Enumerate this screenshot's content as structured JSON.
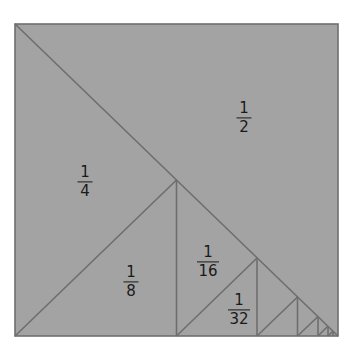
{
  "diagram": {
    "colors": {
      "background": "#ffffff",
      "fill": "#a3a3a3",
      "stroke": "#6e6e6e",
      "text": "#1a1a1a"
    },
    "square": {
      "x1": 15,
      "y1": 24,
      "x2": 338,
      "y2": 336
    },
    "labels": [
      {
        "id": "half",
        "numerator": "1",
        "denominator": "2",
        "x": 244,
        "y": 118
      },
      {
        "id": "quarter",
        "numerator": "1",
        "denominator": "4",
        "x": 85,
        "y": 182
      },
      {
        "id": "eighth",
        "numerator": "1",
        "denominator": "8",
        "x": 131,
        "y": 282
      },
      {
        "id": "sixteenth",
        "numerator": "1",
        "denominator": "16",
        "x": 208,
        "y": 262
      },
      {
        "id": "thirty-second",
        "numerator": "1",
        "denominator": "32",
        "x": 239,
        "y": 310
      }
    ],
    "lines": [
      {
        "id": "main-diagonal",
        "x1": 15,
        "y1": 24,
        "x2": 338,
        "y2": 336
      },
      {
        "id": "quarter-hyp",
        "x1": 15,
        "y1": 336,
        "x2": 176.5,
        "y2": 180
      },
      {
        "id": "quarter-vert",
        "x1": 176.5,
        "y1": 180,
        "x2": 176.5,
        "y2": 336
      },
      {
        "id": "sixteenth-hyp",
        "x1": 176.5,
        "y1": 336,
        "x2": 257,
        "y2": 258
      },
      {
        "id": "sixteenth-vert",
        "x1": 257,
        "y1": 258,
        "x2": 257,
        "y2": 336
      },
      {
        "id": "s64-hyp",
        "x1": 257,
        "y1": 336,
        "x2": 297.5,
        "y2": 297
      },
      {
        "id": "s64-vert",
        "x1": 297.5,
        "y1": 297,
        "x2": 297.5,
        "y2": 336
      },
      {
        "id": "s256-hyp",
        "x1": 297.5,
        "y1": 336,
        "x2": 318,
        "y2": 316.5
      },
      {
        "id": "s256-vert",
        "x1": 318,
        "y1": 316.5,
        "x2": 318,
        "y2": 336
      },
      {
        "id": "s1024-hyp",
        "x1": 318,
        "y1": 336,
        "x2": 328,
        "y2": 326
      },
      {
        "id": "s1024-vert",
        "x1": 328,
        "y1": 326,
        "x2": 328,
        "y2": 336
      },
      {
        "id": "s4096-hyp",
        "x1": 328,
        "y1": 336,
        "x2": 333,
        "y2": 331
      },
      {
        "id": "s4096-vert",
        "x1": 333,
        "y1": 331,
        "x2": 333,
        "y2": 336
      }
    ]
  }
}
